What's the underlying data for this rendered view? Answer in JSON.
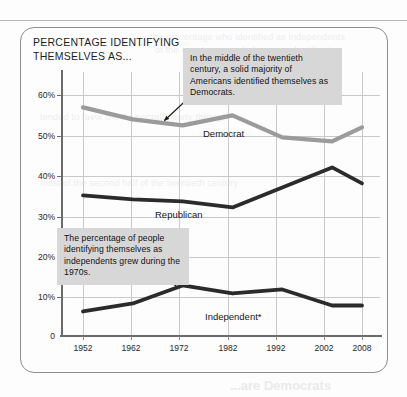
{
  "page": {
    "ghost_title": "...are Democrats",
    "ghost_lines": [
      "the percentage who identified as independents",
      "of the country as a whole, party identification",
      "tended to favor the Democratic party through",
      "most of the second half of the twentieth century"
    ]
  },
  "chart": {
    "title": "PERCENTAGE IDENTIFYING\nTHEMSELVES AS...",
    "callouts": [
      {
        "name": "democrat-callout",
        "text": "In the middle of the twentieth century, a solid majority of Americans identified themselves as Democrats."
      },
      {
        "name": "independent-callout",
        "text": "The percentage of people identifying themselves as independents grew during the 1970s."
      }
    ],
    "series_labels": {
      "democrat": "Democrat",
      "republican": "Republican",
      "independent": "Independent*"
    },
    "colors": {
      "democrat": "#9b9b9b",
      "republican": "#2b2b2b",
      "independent": "#2b2b2b",
      "gridline": "#c9c9c9",
      "axis": "#6b6b6b",
      "callout_bg": "#d7d7d7",
      "card_border": "#8d8d8d"
    }
  },
  "chart_data": {
    "type": "line",
    "title": "PERCENTAGE IDENTIFYING THEMSELVES AS...",
    "xlabel": "",
    "ylabel": "",
    "x": [
      1952,
      1962,
      1972,
      1982,
      1992,
      2002,
      2008
    ],
    "xtick_labels": [
      "1952",
      "1962",
      "1972",
      "1982",
      "1992",
      "2002",
      "2008"
    ],
    "ytick_labels": [
      "0",
      "10%",
      "20%",
      "30%",
      "40%",
      "50%",
      "60%"
    ],
    "ytick_values": [
      0,
      10,
      20,
      30,
      40,
      50,
      60
    ],
    "ylim": [
      0,
      65
    ],
    "grid": true,
    "legend": "inline-labels",
    "series": [
      {
        "name": "Democrat",
        "color": "#9b9b9b",
        "values": [
          57,
          54,
          52.5,
          55,
          49.5,
          48.5,
          52
        ]
      },
      {
        "name": "Republican",
        "color": "#2b2b2b",
        "values": [
          35,
          34,
          33.5,
          32,
          37,
          42,
          38
        ]
      },
      {
        "name": "Independent*",
        "color": "#2b2b2b",
        "values": [
          6,
          8,
          12.5,
          10.5,
          11.5,
          7.5,
          7.5
        ]
      }
    ],
    "annotations": [
      {
        "text": "In the middle of the twentieth century, a solid majority of Americans identified themselves as Democrats.",
        "points_to_series": "Democrat",
        "points_to_x": 1972
      },
      {
        "text": "The percentage of people identifying themselves as independents grew during the 1970s.",
        "points_to_series": "Independent*",
        "points_to_x": 1972
      }
    ]
  }
}
